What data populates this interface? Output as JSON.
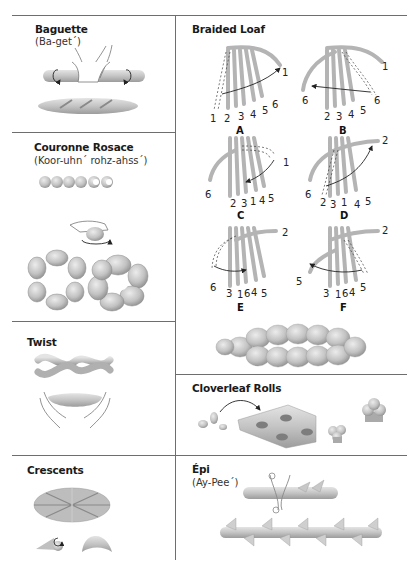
{
  "sections": {
    "baguette": {
      "title": "Baguette",
      "pronunciation": "(Ba-get´)"
    },
    "couronne": {
      "title": "Couronne Rosace",
      "pronunciation": "(Koor-uhn´ rohz-ahss´)"
    },
    "twist": {
      "title": "Twist"
    },
    "crescents": {
      "title": "Crescents"
    },
    "braided": {
      "title": "Braided Loaf",
      "steps": [
        {
          "letter": "A",
          "labels": [
            "1",
            "2",
            "3",
            "4",
            "5",
            "6",
            "1"
          ]
        },
        {
          "letter": "B",
          "labels": [
            "6",
            "2",
            "3",
            "4",
            "5",
            "6",
            "1"
          ]
        },
        {
          "letter": "C",
          "labels": [
            "6",
            "2",
            "3",
            "1",
            "4",
            "5",
            "1"
          ]
        },
        {
          "letter": "D",
          "labels": [
            "6",
            "2",
            "3",
            "1",
            "4",
            "5",
            "2"
          ]
        },
        {
          "letter": "E",
          "labels": [
            "6",
            "3",
            "1",
            "6",
            "4",
            "5",
            "2"
          ]
        },
        {
          "letter": "F",
          "labels": [
            "5",
            "3",
            "1",
            "6",
            "4",
            "5",
            "2"
          ]
        }
      ]
    },
    "cloverleaf": {
      "title": "Cloverleaf Rolls"
    },
    "epi": {
      "title": "Épi",
      "pronunciation": "(Ay-Pee´)"
    }
  },
  "colors": {
    "dough": "#c8c8c8",
    "dough_dark": "#9a9a9a",
    "rule": "#6e6e6e"
  }
}
